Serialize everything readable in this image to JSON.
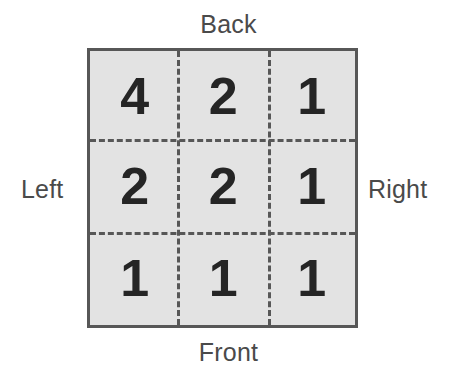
{
  "figure": {
    "type": "grid-diagram",
    "title": "",
    "background_color": "#ffffff",
    "square_fill_color": "#e3e3e3",
    "square_border_color": "#575757",
    "dashed_line_color": "#575757",
    "number_color": "#252525",
    "label_color": "#4a4a4a"
  },
  "labels": {
    "back": "Back",
    "front": "Front",
    "left": "Left",
    "right": "Right"
  },
  "grid": {
    "rows": 3,
    "columns": 3,
    "cells": [
      [
        {
          "value": "4",
          "position": "back-left"
        },
        {
          "value": "2",
          "position": "back-center"
        },
        {
          "value": "1",
          "position": "back-right"
        }
      ],
      [
        {
          "value": "2",
          "position": "middle-left"
        },
        {
          "value": "2",
          "position": "middle-center"
        },
        {
          "value": "1",
          "position": "middle-right"
        }
      ],
      [
        {
          "value": "1",
          "position": "front-left"
        },
        {
          "value": "1",
          "position": "front-center"
        },
        {
          "value": "1",
          "position": "front-right"
        }
      ]
    ]
  },
  "chart_data": {
    "type": "heatmap",
    "title": "",
    "xlabel": "",
    "ylabel": "",
    "row_labels": [
      "Back",
      "Middle",
      "Front"
    ],
    "column_labels": [
      "Left",
      "Center",
      "Right"
    ],
    "values": [
      [
        4,
        2,
        1
      ],
      [
        2,
        2,
        1
      ],
      [
        1,
        1,
        1
      ]
    ],
    "annotations": [
      "Back",
      "Front",
      "Left",
      "Right"
    ],
    "grid": true,
    "legend": "none"
  }
}
